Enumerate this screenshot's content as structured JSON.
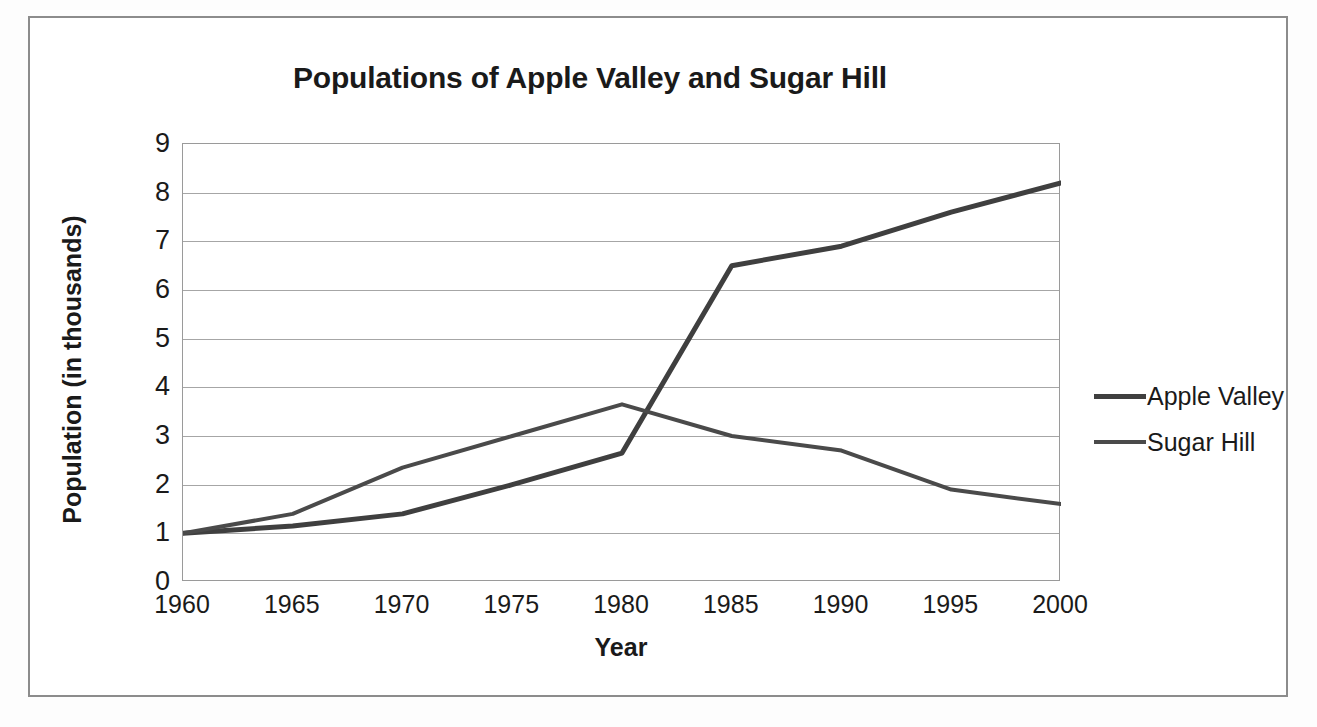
{
  "chart_data": {
    "type": "line",
    "title": "Populations of Apple Valley and Sugar Hill",
    "xlabel": "Year",
    "ylabel": "Population (in thousands)",
    "x": [
      1960,
      1965,
      1970,
      1975,
      1980,
      1985,
      1990,
      1995,
      2000
    ],
    "xtick_labels": [
      "1960",
      "1965",
      "1970",
      "1975",
      "1980",
      "1985",
      "1990",
      "1995",
      "2000"
    ],
    "ytick_labels": [
      "0",
      "1",
      "2",
      "3",
      "4",
      "5",
      "6",
      "7",
      "8",
      "9"
    ],
    "ylim": [
      0,
      9
    ],
    "ytick_step": 1,
    "grid": "horizontal",
    "legend_position": "right",
    "series": [
      {
        "name": "Apple Valley",
        "color": "#3f3f3f",
        "line_width": 5,
        "values": [
          1.0,
          1.15,
          1.4,
          2.0,
          2.65,
          6.5,
          6.9,
          7.6,
          8.2
        ]
      },
      {
        "name": "Sugar Hill",
        "color": "#4a4a4a",
        "line_width": 4,
        "values": [
          1.0,
          1.4,
          2.35,
          3.0,
          3.65,
          3.0,
          2.7,
          1.9,
          1.6
        ]
      }
    ]
  },
  "frame": {
    "border_color": "#8c8c8c",
    "plot_border_color": "#9a9a9a",
    "gridline_color": "#a6a6a6",
    "background": "#ffffff"
  }
}
